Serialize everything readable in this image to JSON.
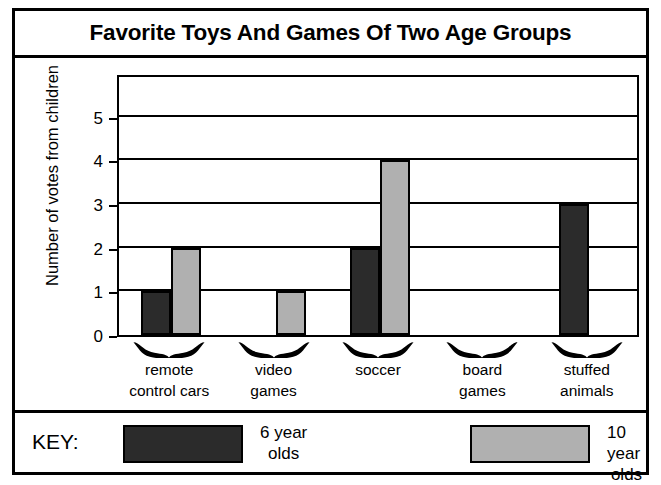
{
  "chart_data": {
    "type": "bar",
    "title": "Favorite Toys And Games Of Two Age Groups",
    "xlabel": "",
    "ylabel": "Number of votes from children",
    "ylim": [
      0,
      6
    ],
    "yticks": [
      0,
      1,
      2,
      3,
      4,
      5
    ],
    "grid": true,
    "legend_position": "bottom",
    "categories": [
      "remote control cars",
      "video games",
      "soccer",
      "board games",
      "stuffed animals"
    ],
    "category_lines": [
      [
        "remote",
        "control cars"
      ],
      [
        "video",
        "games"
      ],
      [
        "soccer",
        ""
      ],
      [
        "board",
        "games"
      ],
      [
        "stuffed",
        "animals"
      ]
    ],
    "series": [
      {
        "name": "6 year olds",
        "color": "#2b2b2b",
        "values": [
          1,
          0,
          2,
          0,
          3
        ]
      },
      {
        "name": "10 year olds",
        "color": "#b0b0b0",
        "values": [
          2,
          1,
          4,
          0,
          0
        ]
      }
    ]
  },
  "ticks": {
    "t0": "0",
    "t1": "1",
    "t2": "2",
    "t3": "3",
    "t4": "4",
    "t5": "5"
  },
  "key": {
    "label": "KEY:",
    "entries": [
      {
        "swatch_color": "#2b2b2b",
        "line1": "6 year",
        "line2": "olds"
      },
      {
        "swatch_color": "#b0b0b0",
        "line1": "10 year",
        "line2": "olds"
      }
    ]
  },
  "icons": {
    "brace": "curly-brace-down-icon"
  }
}
